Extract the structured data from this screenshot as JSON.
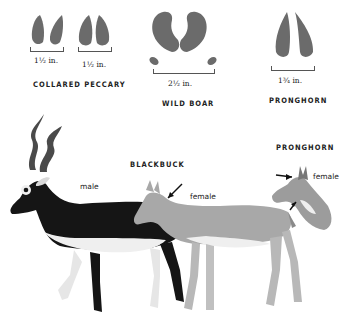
{
  "tracks": [
    {
      "species": "COLLARED PECCARY",
      "measurements": [
        "1½ in.",
        "1½ in."
      ]
    },
    {
      "species": "WILD BOAR",
      "measurements": [
        "2½ in."
      ]
    },
    {
      "species": "PRONGHORN",
      "measurements": [
        "1¾ in."
      ]
    }
  ],
  "illustration": {
    "blackbuck_title": "BLACKBUCK",
    "blackbuck_male_label": "male",
    "blackbuck_female_label": "female",
    "pronghorn_title": "PRONGHORN",
    "pronghorn_female_label": "female"
  },
  "colors": {
    "track_fill": "#6b6b6b",
    "male_body": "#151515",
    "female_body": "#a8a8a8",
    "belly": "#efefef"
  }
}
